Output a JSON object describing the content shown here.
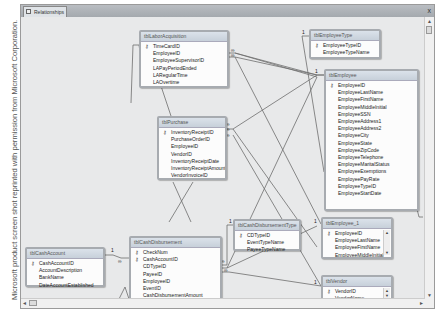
{
  "credit": "Microsoft product screen shot reprinted with permission from Microsoft Corporation.",
  "window": {
    "tab_label": "Relationships",
    "close_label": "x"
  },
  "scroll": {
    "up": "▲",
    "down": "▼",
    "left": "◄",
    "right": "►"
  },
  "tables": {
    "labor": {
      "name": "tblLaborAcquisition",
      "fields": [
        {
          "name": "TimeCardID",
          "key": true
        },
        {
          "name": "EmployeeID",
          "key": false
        },
        {
          "name": "EmployeeSupervisorID",
          "key": false
        },
        {
          "name": "LAPayPeriodEnded",
          "key": false
        },
        {
          "name": "LARegularTime",
          "key": false
        },
        {
          "name": "LAOvertime",
          "key": false
        }
      ]
    },
    "emptype": {
      "name": "tblEmployeeType",
      "fields": [
        {
          "name": "EmployeeTypeID",
          "key": true
        },
        {
          "name": "EmployeeTypeName",
          "key": false
        }
      ]
    },
    "employee": {
      "name": "tblEmployee",
      "fields": [
        {
          "name": "EmployeeID",
          "key": true
        },
        {
          "name": "EmployeeLastName",
          "key": false
        },
        {
          "name": "EmployeeFirstName",
          "key": false
        },
        {
          "name": "EmployeeMiddleInitial",
          "key": false
        },
        {
          "name": "EmployeeSSN",
          "key": false
        },
        {
          "name": "EmployeeAddress1",
          "key": false
        },
        {
          "name": "EmployeeAddress2",
          "key": false
        },
        {
          "name": "EmployeeCity",
          "key": false
        },
        {
          "name": "EmployeeState",
          "key": false
        },
        {
          "name": "EmployeeZipCode",
          "key": false
        },
        {
          "name": "EmployeeTelephone",
          "key": false
        },
        {
          "name": "EmployeeMaritalStatus",
          "key": false
        },
        {
          "name": "EmployeeExemptions",
          "key": false
        },
        {
          "name": "EmployeePayRate",
          "key": false
        },
        {
          "name": "EmployeeTypeID",
          "key": false
        },
        {
          "name": "EmployeeStartDate",
          "key": false
        }
      ]
    },
    "purchase": {
      "name": "tblPurchase",
      "fields": [
        {
          "name": "InventoryReceiptID",
          "key": true
        },
        {
          "name": "PurchaseOrderID",
          "key": false
        },
        {
          "name": "EmployeeID",
          "key": false
        },
        {
          "name": "VendorID",
          "key": false
        },
        {
          "name": "InventoryReceiptDate",
          "key": false
        },
        {
          "name": "InventoryReceiptAmount",
          "key": false
        },
        {
          "name": "VendorInvoiceID",
          "key": false
        }
      ]
    },
    "cdtype": {
      "name": "tblCashDisbursementType",
      "fields": [
        {
          "name": "CDTypeID",
          "key": true
        },
        {
          "name": "EventTypeName",
          "key": false
        },
        {
          "name": "PayeeTypeName",
          "key": false
        }
      ]
    },
    "employee1": {
      "name": "tblEmployee_1",
      "fields": [
        {
          "name": "EmployeeID",
          "key": true
        },
        {
          "name": "EmployeeLastName",
          "key": false
        },
        {
          "name": "EmployeeFirstName",
          "key": false
        },
        {
          "name": "EmployeeMiddleInitial",
          "key": false
        }
      ]
    },
    "cashaccount": {
      "name": "tblCashAccount",
      "fields": [
        {
          "name": "CashAccountID",
          "key": true
        },
        {
          "name": "AccountDescription",
          "key": false
        },
        {
          "name": "BankName",
          "key": false
        },
        {
          "name": "DateAccountEstablished",
          "key": false
        }
      ]
    },
    "cashdisb": {
      "name": "tblCashDisbursement",
      "fields": [
        {
          "name": "CheckNum",
          "key": true
        },
        {
          "name": "CashAccountID",
          "key": true
        },
        {
          "name": "CDTypeID",
          "key": false
        },
        {
          "name": "PayeeID",
          "key": false
        },
        {
          "name": "EmployeeID",
          "key": false
        },
        {
          "name": "EventID",
          "key": false
        },
        {
          "name": "CashDisbursementAmount",
          "key": false
        },
        {
          "name": "CashDisbursementDate",
          "key": false
        }
      ]
    },
    "vendor": {
      "name": "tblVendor",
      "fields": [
        {
          "name": "VendorID",
          "key": true
        },
        {
          "name": "VendorName",
          "key": false
        }
      ]
    }
  },
  "cardinality": {
    "one": "1",
    "many": "∞"
  }
}
